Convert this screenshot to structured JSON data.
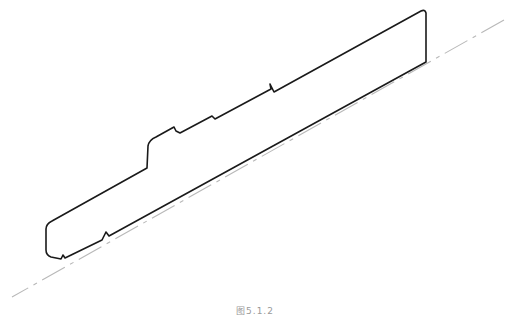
{
  "figure": {
    "caption": "图5.1.2"
  },
  "colors": {
    "outline": "#1a1a1a",
    "centerline": "#b8b8b8",
    "background": "#ffffff",
    "caption": "#9a9a9a"
  }
}
